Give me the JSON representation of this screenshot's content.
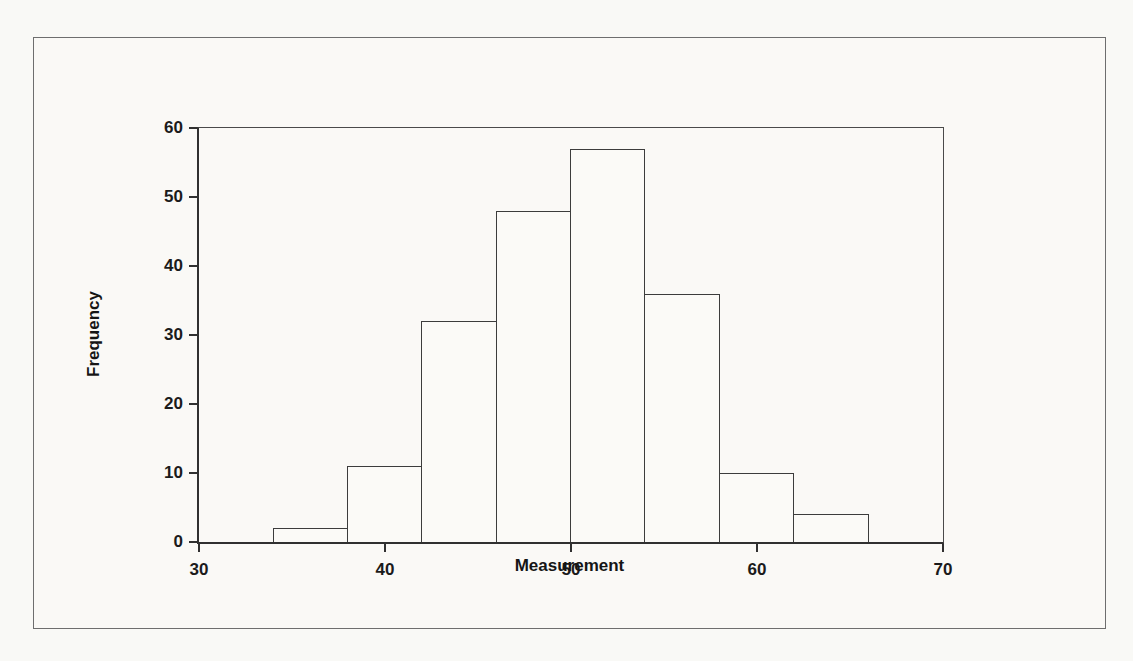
{
  "page": {
    "background_color": "#f9f9f6",
    "frame_border_color": "#6e6e6e"
  },
  "chart_data": {
    "type": "bar",
    "subtype": "histogram",
    "title": "",
    "xlabel": "Measurement",
    "ylabel": "Frequency",
    "bin_edges": [
      34,
      38,
      42,
      46,
      50,
      54,
      58,
      62,
      66
    ],
    "values": [
      2,
      11,
      32,
      48,
      57,
      36,
      10,
      4
    ],
    "xlim": [
      30,
      70
    ],
    "ylim": [
      0,
      60
    ],
    "x_ticks": [
      30,
      40,
      50,
      60,
      70
    ],
    "y_ticks": [
      0,
      10,
      20,
      30,
      40,
      50,
      60
    ],
    "grid": false,
    "legend": false,
    "bar_fill_color": "#fbfaf7",
    "bar_stroke_color": "#3c3c3c",
    "axis_color": "#303030",
    "text_color": "#1b1b1b"
  }
}
